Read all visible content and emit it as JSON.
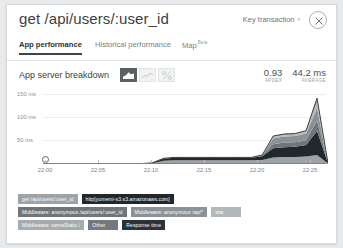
{
  "header": {
    "title": "get /api/users/:user_id",
    "key_transaction_label": "Key transaction",
    "key_transaction_chevron": "›",
    "close_icon": "close-icon"
  },
  "tabs": [
    {
      "label": "App performance",
      "active": true,
      "badge": ""
    },
    {
      "label": "Historical performance",
      "active": false,
      "badge": ""
    },
    {
      "label": "Map",
      "active": false,
      "badge": "Beta"
    }
  ],
  "chart_header": {
    "title": "App server breakdown",
    "controls": [
      {
        "name": "area-chart-toggle",
        "active": true
      },
      {
        "name": "line-chart-toggle",
        "active": false
      },
      {
        "name": "percent-chart-toggle",
        "active": false
      }
    ],
    "stats": [
      {
        "value": "0.93",
        "label": "APDEX"
      },
      {
        "value": "44.2 ms",
        "label": "AVERAGE"
      }
    ]
  },
  "chart_data": {
    "type": "area",
    "title": "App server breakdown",
    "xlabel": "",
    "ylabel": "",
    "ylim": [
      0,
      175
    ],
    "ytick_labels": [
      "150 ms",
      "100 ms",
      "50 ms"
    ],
    "yticks": [
      150,
      100,
      50
    ],
    "xtick_labels": [
      "22:00",
      "22:05",
      "22:10",
      "22:15",
      "22:20",
      "22:25"
    ],
    "grid": true,
    "legend_position": "bottom",
    "stacked": true,
    "x": [
      "22:00",
      "22:01",
      "22:02",
      "22:03",
      "22:04",
      "22:05",
      "22:06",
      "22:07",
      "22:08",
      "22:09",
      "22:10",
      "22:11",
      "22:12",
      "22:13",
      "22:14",
      "22:15",
      "22:16",
      "22:17",
      "22:18",
      "22:19",
      "22:20",
      "22:21",
      "22:22",
      "22:23",
      "22:24",
      "22:25",
      "22:26"
    ],
    "series": [
      {
        "name": "get /api/users/:user_id",
        "color": "#9da3a7",
        "values": [
          1,
          1,
          1,
          1,
          1,
          1,
          1,
          1,
          1,
          1,
          2,
          8,
          9,
          9,
          9,
          9,
          9,
          9,
          9,
          9,
          10,
          16,
          17,
          17,
          18,
          22,
          1
        ]
      },
      {
        "name": "http[yumemi-s3.s3.amazonaws.com]",
        "color": "#20282c",
        "values": [
          0,
          0,
          0,
          0,
          0,
          0,
          0,
          0,
          0,
          0,
          1,
          5,
          6,
          6,
          6,
          6,
          6,
          6,
          6,
          6,
          9,
          22,
          24,
          25,
          28,
          58,
          1
        ]
      },
      {
        "name": "Middleware: anonymous /api/users/:user_id",
        "color": "#6f7579",
        "values": [
          0,
          0,
          0,
          0,
          0,
          0,
          0,
          0,
          0,
          0,
          0,
          1,
          1,
          1,
          1,
          1,
          1,
          1,
          1,
          1,
          2,
          10,
          11,
          11,
          12,
          26,
          0
        ]
      },
      {
        "name": "Middleware: anonymous /ap/*",
        "color": "#8b9195",
        "values": [
          0,
          0,
          0,
          0,
          0,
          0,
          0,
          0,
          0,
          0,
          0,
          0,
          0,
          0,
          0,
          0,
          0,
          0,
          0,
          0,
          1,
          14,
          15,
          15,
          16,
          30,
          0
        ]
      },
      {
        "name": "stat",
        "color": "#b2b7ba",
        "values": [
          0,
          0,
          0,
          0,
          0,
          0,
          0,
          0,
          0,
          0,
          0,
          0,
          0,
          0,
          0,
          0,
          0,
          0,
          0,
          0,
          0,
          3,
          3,
          3,
          4,
          12,
          0
        ]
      },
      {
        "name": "Middleware: serveStatic /",
        "color": "#a6abae",
        "values": [
          0,
          0,
          0,
          0,
          0,
          0,
          0,
          0,
          0,
          0,
          0,
          0,
          0,
          0,
          0,
          0,
          0,
          0,
          0,
          0,
          0,
          2,
          2,
          2,
          2,
          8,
          0
        ]
      },
      {
        "name": "Other",
        "color": "#73797d",
        "values": [
          0,
          0,
          0,
          0,
          0,
          0,
          0,
          0,
          0,
          0,
          0,
          0,
          0,
          0,
          0,
          0,
          0,
          0,
          0,
          0,
          0,
          1,
          1,
          1,
          1,
          4,
          0
        ]
      }
    ],
    "response_time_line": {
      "name": "Response time",
      "color": "#2c3336"
    }
  },
  "legend": {
    "rows": [
      [
        {
          "label": "get /api/users/:user_id",
          "color": "#9da3a7"
        },
        {
          "label": "http[yumemi-s3.s3.amazonaws.com]",
          "color": "#20282c"
        }
      ],
      [
        {
          "label": "Middleware: anonymous /api/users/:user_id",
          "color": "#6f7579"
        },
        {
          "label": "Middleware: anonymous /ap/*",
          "color": "#8b9195"
        },
        {
          "label": "stat",
          "color": "#b2b7ba"
        }
      ],
      [
        {
          "label": "Middleware: serveStatic /",
          "color": "#a6abae"
        },
        {
          "label": "Other",
          "color": "#73797d"
        },
        {
          "label": "Response time",
          "color": "#2c3336"
        }
      ]
    ]
  }
}
